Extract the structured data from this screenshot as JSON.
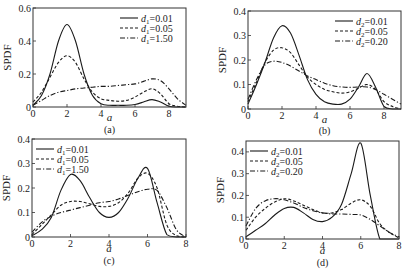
{
  "figure": {
    "panels": [
      "a",
      "b",
      "c",
      "d"
    ]
  },
  "chart_data": [
    {
      "panel": "(a)",
      "type": "line",
      "xlabel": "a",
      "ylabel": "SPDF",
      "xlim": [
        0,
        9
      ],
      "ylim": [
        0,
        0.6
      ],
      "xticks": [
        0,
        2,
        4,
        6,
        8
      ],
      "yticks": [
        0,
        0.2,
        0.4,
        0.6
      ],
      "ytick_labels": [
        "0",
        "0.2",
        "0.4",
        "0.6"
      ],
      "grid": false,
      "legend_position": "upper right",
      "legend_var": "d",
      "legend_sub": "1",
      "x": [
        0,
        0.5,
        1,
        1.5,
        2,
        2.5,
        3,
        3.5,
        4,
        4.5,
        5,
        5.5,
        6,
        6.5,
        7,
        7.5,
        8,
        8.5,
        9
      ],
      "series": [
        {
          "name": "d1=0.01",
          "label_value": "=0.01",
          "style": "solid",
          "values": [
            0.01,
            0.07,
            0.2,
            0.4,
            0.5,
            0.4,
            0.2,
            0.07,
            0.02,
            0.01,
            0.01,
            0.01,
            0.015,
            0.03,
            0.045,
            0.03,
            0.005,
            0.0,
            0.0
          ]
        },
        {
          "name": "d1=0.05",
          "label_value": "=0.05",
          "style": "dashed",
          "values": [
            0.03,
            0.09,
            0.18,
            0.27,
            0.31,
            0.27,
            0.17,
            0.09,
            0.05,
            0.04,
            0.035,
            0.04,
            0.06,
            0.09,
            0.11,
            0.08,
            0.02,
            0.005,
            0.0
          ]
        },
        {
          "name": "d1=1.50",
          "label_value": "=1.50",
          "style": "dashdot",
          "values": [
            0.01,
            0.04,
            0.07,
            0.09,
            0.1,
            0.11,
            0.115,
            0.12,
            0.125,
            0.125,
            0.13,
            0.135,
            0.14,
            0.155,
            0.17,
            0.16,
            0.11,
            0.05,
            0.01
          ]
        }
      ]
    },
    {
      "panel": "(b)",
      "type": "line",
      "xlabel": "a",
      "ylabel": "SPDF",
      "xlim": [
        0,
        9
      ],
      "ylim": [
        0,
        0.4
      ],
      "xticks": [
        0,
        2,
        4,
        6,
        8
      ],
      "yticks": [
        0,
        0.1,
        0.2,
        0.3,
        0.4
      ],
      "ytick_labels": [
        "0",
        "0.1",
        "0.2",
        "0.3",
        "0.4"
      ],
      "grid": false,
      "legend_position": "upper right",
      "legend_var": "d",
      "legend_sub": "2",
      "x": [
        0,
        0.5,
        1,
        1.5,
        2,
        2.5,
        3,
        3.5,
        4,
        4.5,
        5,
        5.5,
        6,
        6.5,
        7,
        7.5,
        8,
        8.5,
        9
      ],
      "series": [
        {
          "name": "d2=0.01",
          "label_value": "=0.01",
          "style": "solid",
          "values": [
            0.02,
            0.1,
            0.19,
            0.29,
            0.34,
            0.31,
            0.22,
            0.12,
            0.06,
            0.03,
            0.02,
            0.02,
            0.04,
            0.09,
            0.145,
            0.09,
            0.01,
            0.0,
            0.0
          ]
        },
        {
          "name": "d2=0.05",
          "label_value": "=0.05",
          "style": "dashed",
          "values": [
            0.03,
            0.11,
            0.19,
            0.24,
            0.25,
            0.23,
            0.18,
            0.13,
            0.1,
            0.08,
            0.07,
            0.065,
            0.07,
            0.085,
            0.1,
            0.08,
            0.03,
            0.01,
            0.0
          ]
        },
        {
          "name": "d2=0.20",
          "label_value": "=0.20",
          "style": "dashdot",
          "values": [
            0.04,
            0.12,
            0.18,
            0.195,
            0.19,
            0.175,
            0.155,
            0.135,
            0.12,
            0.105,
            0.095,
            0.09,
            0.088,
            0.09,
            0.09,
            0.08,
            0.06,
            0.04,
            0.02
          ]
        }
      ]
    },
    {
      "panel": "(c)",
      "type": "line",
      "xlabel": "a",
      "ylabel": "SPDF",
      "xlim": [
        0,
        8
      ],
      "ylim": [
        0,
        0.4
      ],
      "xticks": [
        0,
        2,
        4,
        6,
        8
      ],
      "yticks": [
        0,
        0.1,
        0.2,
        0.3,
        0.4
      ],
      "ytick_labels": [
        "0",
        "0.1",
        "0.2",
        "0.3",
        "0.4"
      ],
      "grid": false,
      "legend_position": "upper left",
      "legend_var": "d",
      "legend_sub": "1",
      "x": [
        0,
        0.5,
        1,
        1.5,
        2,
        2.5,
        3,
        3.5,
        4,
        4.5,
        5,
        5.5,
        6,
        6.5,
        7,
        7.5,
        8
      ],
      "series": [
        {
          "name": "d1=0.01",
          "label_value": "=0.01",
          "style": "solid",
          "values": [
            0.005,
            0.03,
            0.08,
            0.19,
            0.255,
            0.23,
            0.16,
            0.1,
            0.08,
            0.1,
            0.16,
            0.24,
            0.28,
            0.14,
            0.01,
            0.0,
            0.0
          ]
        },
        {
          "name": "d1=0.05",
          "label_value": "=0.05",
          "style": "dashed",
          "values": [
            0.01,
            0.05,
            0.09,
            0.13,
            0.145,
            0.145,
            0.135,
            0.125,
            0.125,
            0.14,
            0.18,
            0.24,
            0.26,
            0.2,
            0.05,
            0.005,
            0.0
          ]
        },
        {
          "name": "d1=1.50",
          "label_value": "=1.50",
          "style": "dashdot",
          "values": [
            0.02,
            0.06,
            0.085,
            0.1,
            0.11,
            0.12,
            0.13,
            0.14,
            0.145,
            0.155,
            0.17,
            0.185,
            0.195,
            0.19,
            0.12,
            0.03,
            0.0
          ]
        }
      ]
    },
    {
      "panel": "(d)",
      "type": "line",
      "xlabel": "a",
      "ylabel": "SPDF",
      "xlim": [
        0,
        8
      ],
      "ylim": [
        0,
        0.45
      ],
      "xticks": [
        0,
        2,
        4,
        6,
        8
      ],
      "yticks": [
        0,
        0.1,
        0.2,
        0.3,
        0.4
      ],
      "ytick_labels": [
        "0",
        "0.1",
        "0.2",
        "0.3",
        "0.4"
      ],
      "grid": false,
      "legend_position": "upper left",
      "legend_var": "d",
      "legend_sub": "2",
      "x": [
        0,
        0.5,
        1,
        1.5,
        2,
        2.5,
        3,
        3.5,
        4,
        4.5,
        5,
        5.5,
        6,
        6.5,
        7,
        7.5,
        8
      ],
      "series": [
        {
          "name": "d2=0.01",
          "label_value": "=0.01",
          "style": "solid",
          "values": [
            0.01,
            0.04,
            0.07,
            0.11,
            0.14,
            0.145,
            0.12,
            0.09,
            0.08,
            0.1,
            0.16,
            0.3,
            0.44,
            0.2,
            0.0,
            0.0,
            0.0
          ]
        },
        {
          "name": "d2=0.05",
          "label_value": "=0.05",
          "style": "dashed",
          "values": [
            0.04,
            0.1,
            0.14,
            0.17,
            0.185,
            0.175,
            0.155,
            0.135,
            0.12,
            0.12,
            0.135,
            0.165,
            0.18,
            0.15,
            0.07,
            0.03,
            0.005
          ]
        },
        {
          "name": "d2=0.20",
          "label_value": "=0.20",
          "style": "dashdot",
          "values": [
            0.06,
            0.14,
            0.175,
            0.185,
            0.18,
            0.165,
            0.145,
            0.13,
            0.12,
            0.115,
            0.115,
            0.113,
            0.11,
            0.09,
            0.06,
            0.03,
            0.01
          ]
        }
      ]
    }
  ],
  "layout": [
    {
      "left": 33,
      "top": 8,
      "right": 186,
      "bottom": 107,
      "ytop_value": 0.6,
      "label_x": 100,
      "label_y": 133,
      "xlabel_y": 121
    },
    {
      "left": 248,
      "top": 11,
      "right": 401,
      "bottom": 109,
      "ytop_value": 0.4,
      "label_x": 324,
      "label_y": 134,
      "xlabel_y": 123
    },
    {
      "left": 32,
      "top": 139,
      "right": 186,
      "bottom": 237,
      "ytop_value": 0.4,
      "label_x": 110,
      "label_y": 264,
      "xlabel_y": 252
    },
    {
      "left": 246,
      "top": 141,
      "right": 399,
      "bottom": 239,
      "ytop_value": 0.45,
      "label_x": 324,
      "label_y": 266,
      "xlabel_y": 254
    }
  ]
}
